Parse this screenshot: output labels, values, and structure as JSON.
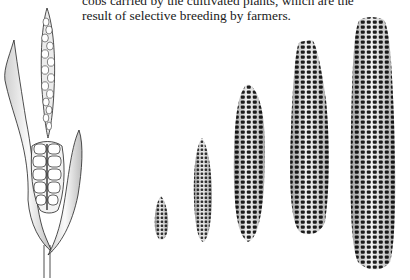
{
  "caption": {
    "line1": "cobs carried by the cultivated plants, which are the",
    "line2": "result of selective breeding by farmers."
  },
  "illustration": {
    "wild_plant": "teosinte-ear-with-husk",
    "cobs": [
      {
        "index": 1,
        "size": "smallest"
      },
      {
        "index": 2,
        "size": "small"
      },
      {
        "index": 3,
        "size": "medium"
      },
      {
        "index": 4,
        "size": "large"
      },
      {
        "index": 5,
        "size": "largest"
      }
    ],
    "colors": {
      "ink": "#1a1a1a",
      "paper": "#ffffff",
      "shade": "#8a8a8a"
    }
  }
}
